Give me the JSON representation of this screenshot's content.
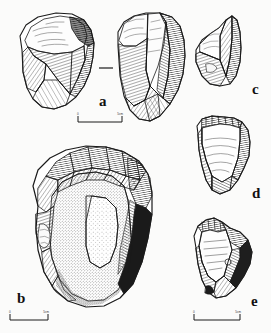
{
  "figure": {
    "kind": "archaeological-lithic-plate",
    "background_color": "#fbfbfa",
    "ink_color": "#1a1a1a",
    "specimens": [
      {
        "id": "a",
        "label": "a",
        "name": "core-chopper-two-views",
        "description": "Flaked stone core shown in two views, left and right",
        "views": 2
      },
      {
        "id": "b",
        "label": "b",
        "name": "discoidal-core-with-cortex",
        "description": "Large discoidal core with stippled cortex surface",
        "views": 1
      },
      {
        "id": "c",
        "label": "c",
        "name": "pointed-flake-tool",
        "description": "Pointed flake with steep retouch",
        "views": 1
      },
      {
        "id": "d",
        "label": "d",
        "name": "flake-scraper",
        "description": "Broad flake with lateral retouch",
        "views": 1
      },
      {
        "id": "e",
        "label": "e",
        "name": "angular-flake",
        "description": "Angular flake with cortical back",
        "views": 1
      }
    ],
    "scale_bars": [
      {
        "name": "scale-bar-a",
        "start_tick": "0",
        "end_tick": "5cm"
      },
      {
        "name": "scale-bar-b",
        "start_tick": "0",
        "end_tick": "5cm"
      },
      {
        "name": "scale-bar-e",
        "start_tick": "0",
        "end_tick": "5cm"
      }
    ]
  }
}
